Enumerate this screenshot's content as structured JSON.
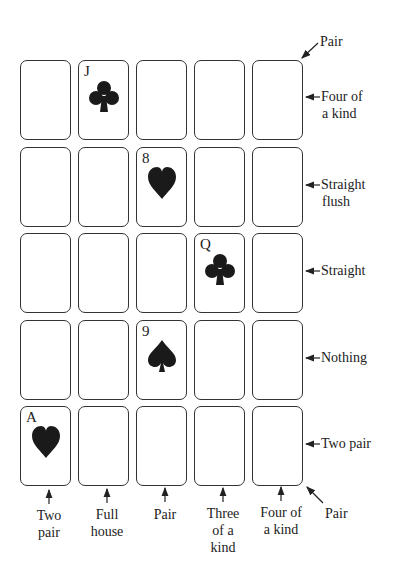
{
  "grid": {
    "rows": 5,
    "cols": 5,
    "cards": [
      {
        "row": 0,
        "col": 1,
        "rank": "J",
        "suit": "club",
        "symbol": "♣"
      },
      {
        "row": 1,
        "col": 2,
        "rank": "8",
        "suit": "heart",
        "symbol": "♥"
      },
      {
        "row": 2,
        "col": 3,
        "rank": "Q",
        "suit": "club",
        "symbol": "♣"
      },
      {
        "row": 3,
        "col": 2,
        "rank": "9",
        "suit": "spade",
        "symbol": "♠"
      },
      {
        "row": 4,
        "col": 0,
        "rank": "A",
        "suit": "heart",
        "symbol": "♥"
      }
    ]
  },
  "labels": {
    "diagonal_top": "Pair",
    "rows": [
      "Four of a kind",
      "Straight flush",
      "Straight",
      "Nothing",
      "Two pair"
    ],
    "row_lines": [
      [
        "Four of",
        "a kind"
      ],
      [
        "Straight",
        "flush"
      ],
      [
        "Straight"
      ],
      [
        "Nothing"
      ],
      [
        "Two pair"
      ]
    ],
    "columns": [
      "Two pair",
      "Full house",
      "Pair",
      "Three of a kind",
      "Four of a kind"
    ],
    "column_lines": [
      [
        "Two",
        "pair"
      ],
      [
        "Full",
        "house"
      ],
      [
        "Pair"
      ],
      [
        "Three",
        "of a",
        "kind"
      ],
      [
        "Four of",
        "a kind"
      ]
    ],
    "diagonal_bottom": "Pair"
  }
}
